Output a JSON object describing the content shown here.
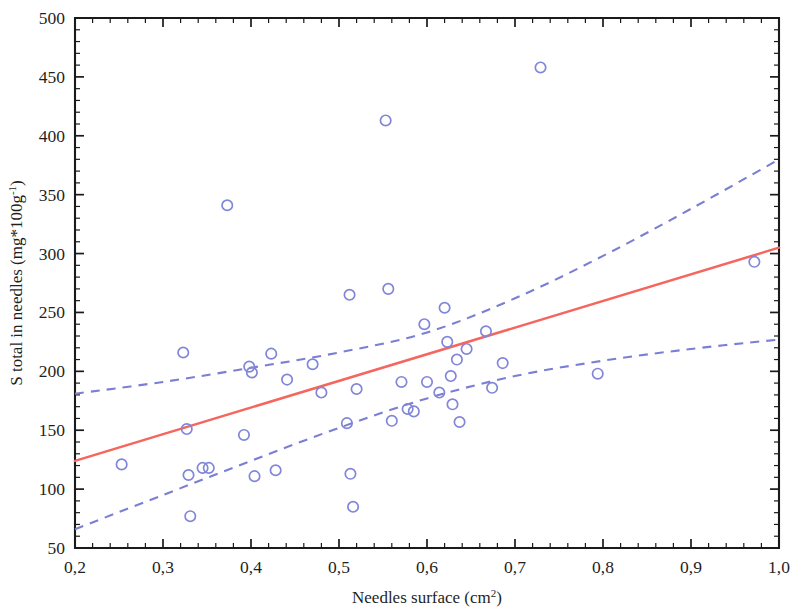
{
  "chart_data": {
    "type": "scatter",
    "title": "",
    "xlabel": "Needles surface (cm2)",
    "xlabel_base": "Needles surface (cm",
    "xlabel_sup": "2",
    "xlabel_tail": ")",
    "ylabel": "S total in needles (mg*100g-1)",
    "ylabel_base": "S total in needles (mg*100g",
    "ylabel_sup": "-1",
    "ylabel_tail": ")",
    "xlim": [
      0.2,
      1.0
    ],
    "ylim": [
      50,
      500
    ],
    "grid": false,
    "legend": null,
    "x_ticks": [
      0.2,
      0.3,
      0.4,
      0.5,
      0.6,
      0.7,
      0.8,
      0.9,
      1.0
    ],
    "x_tick_labels": [
      "0,2",
      "0,3",
      "0,4",
      "0,5",
      "0,6",
      "0,7",
      "0,8",
      "0,9",
      "1,0"
    ],
    "x_minor_per_interval": 5,
    "y_ticks": [
      50,
      100,
      150,
      200,
      250,
      300,
      350,
      400,
      450,
      500
    ],
    "y_tick_labels": [
      "50",
      "100",
      "150",
      "200",
      "250",
      "300",
      "350",
      "400",
      "450",
      "500"
    ],
    "y_minor_per_interval": 5,
    "marker": "open-circle",
    "marker_color": "#8186d8",
    "marker_radius": 5.2,
    "points": [
      {
        "x": 0.253,
        "y": 121
      },
      {
        "x": 0.323,
        "y": 216
      },
      {
        "x": 0.327,
        "y": 151
      },
      {
        "x": 0.329,
        "y": 112
      },
      {
        "x": 0.331,
        "y": 77
      },
      {
        "x": 0.345,
        "y": 118
      },
      {
        "x": 0.352,
        "y": 118
      },
      {
        "x": 0.373,
        "y": 341
      },
      {
        "x": 0.392,
        "y": 146
      },
      {
        "x": 0.398,
        "y": 204
      },
      {
        "x": 0.401,
        "y": 199
      },
      {
        "x": 0.404,
        "y": 111
      },
      {
        "x": 0.423,
        "y": 215
      },
      {
        "x": 0.428,
        "y": 116
      },
      {
        "x": 0.441,
        "y": 193
      },
      {
        "x": 0.47,
        "y": 206
      },
      {
        "x": 0.48,
        "y": 182
      },
      {
        "x": 0.509,
        "y": 156
      },
      {
        "x": 0.512,
        "y": 265
      },
      {
        "x": 0.513,
        "y": 113
      },
      {
        "x": 0.516,
        "y": 85
      },
      {
        "x": 0.52,
        "y": 185
      },
      {
        "x": 0.553,
        "y": 413
      },
      {
        "x": 0.556,
        "y": 270
      },
      {
        "x": 0.56,
        "y": 158
      },
      {
        "x": 0.571,
        "y": 191
      },
      {
        "x": 0.578,
        "y": 168
      },
      {
        "x": 0.585,
        "y": 166
      },
      {
        "x": 0.597,
        "y": 240
      },
      {
        "x": 0.6,
        "y": 191
      },
      {
        "x": 0.614,
        "y": 182
      },
      {
        "x": 0.62,
        "y": 254
      },
      {
        "x": 0.623,
        "y": 225
      },
      {
        "x": 0.627,
        "y": 196
      },
      {
        "x": 0.629,
        "y": 172
      },
      {
        "x": 0.634,
        "y": 210
      },
      {
        "x": 0.637,
        "y": 157
      },
      {
        "x": 0.645,
        "y": 219
      },
      {
        "x": 0.667,
        "y": 234
      },
      {
        "x": 0.674,
        "y": 186
      },
      {
        "x": 0.686,
        "y": 207
      },
      {
        "x": 0.729,
        "y": 458
      },
      {
        "x": 0.794,
        "y": 198
      },
      {
        "x": 0.972,
        "y": 293
      }
    ],
    "fit_line": {
      "name": "Regression line",
      "color": "#f4665e",
      "style": "solid",
      "x": [
        0.2,
        1.0
      ],
      "y": [
        124,
        305
      ]
    },
    "confidence_bands": [
      {
        "name": "Upper confidence band",
        "color": "#7b7fd4",
        "style": "dashed",
        "x": [
          0.2,
          0.3,
          0.4,
          0.5,
          0.6,
          0.7,
          0.8,
          0.9,
          1.0
        ],
        "y": [
          181,
          191,
          203,
          216,
          233,
          262,
          298,
          338,
          380
        ]
      },
      {
        "name": "Lower confidence band",
        "color": "#7b7fd4",
        "style": "dashed",
        "x": [
          0.2,
          0.3,
          0.4,
          0.5,
          0.6,
          0.7,
          0.8,
          0.9,
          1.0
        ],
        "y": [
          66,
          95,
          124,
          152,
          177,
          196,
          209,
          219,
          227
        ]
      }
    ]
  }
}
